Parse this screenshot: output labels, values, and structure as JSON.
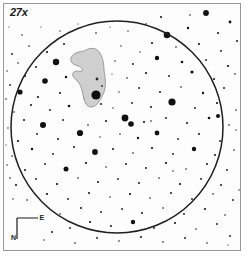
{
  "chart_data": {
    "type": "scatter",
    "magnification_label": "27x",
    "xlabel": "",
    "ylabel": "",
    "xlim": [
      0,
      244
    ],
    "ylim": [
      0,
      258
    ],
    "grid": false,
    "legend": "none",
    "field_circle": {
      "label": "true-field-circle",
      "center_x": 117,
      "center_y": 127,
      "radius": 106,
      "stroke": "#1f1f1f",
      "stroke_width": 1.5,
      "fill": "none"
    },
    "nebula": {
      "label": "nebula-outline",
      "fill": "#cfcfcf",
      "stroke": "#8a8a8a",
      "stroke_width": 0.8,
      "path": "M 86 50 C 91 47 97 48 100 53 C 103 58 104 64 104 70 C 105 76 106 82 105 88 C 104 94 101 99 98 103 C 95 107 91 108 88 106 C 85 104 84 99 83 95 C 82 90 81 86 79 83 C 77 80 74 79 73 76 C 72 73 74 71 77 71 C 79 71 81 72 82 71 C 83 69 81 67 78 66 C 75 65 72 64 71 61 C 70 58 72 55 76 53 C 80 51 83 52 86 50 Z"
    },
    "nebula_core_star": {
      "label": "nebula-core-star",
      "x": 96,
      "y": 95,
      "r": 4.6
    },
    "nebula_inner_stars": [
      {
        "x": 97,
        "y": 79,
        "r": 1.4
      },
      {
        "x": 102,
        "y": 86,
        "r": 0.9
      },
      {
        "x": 101,
        "y": 104,
        "r": 1.1
      }
    ],
    "compass": {
      "label": "compass-rose",
      "north_label": "N",
      "east_label": "E",
      "corner_x": 17,
      "corner_y": 239,
      "arm_up_y": 218,
      "arm_right_x": 38,
      "stroke": "#1a1a1a",
      "stroke_width": 1.2
    },
    "star_scale_note": "radius in px encodes magnitude; larger = brighter",
    "stars": [
      {
        "x": 161,
        "y": 17,
        "r": 1.0
      },
      {
        "x": 206,
        "y": 13,
        "r": 2.9
      },
      {
        "x": 230,
        "y": 22,
        "r": 1.4
      },
      {
        "x": 188,
        "y": 28,
        "r": 1.2
      },
      {
        "x": 218,
        "y": 33,
        "r": 1.0
      },
      {
        "x": 167,
        "y": 35,
        "r": 3.3
      },
      {
        "x": 237,
        "y": 41,
        "r": 1.0
      },
      {
        "x": 146,
        "y": 24,
        "r": 0.8
      },
      {
        "x": 128,
        "y": 31,
        "r": 0.7
      },
      {
        "x": 110,
        "y": 27,
        "r": 0.6
      },
      {
        "x": 96,
        "y": 33,
        "r": 0.8
      },
      {
        "x": 78,
        "y": 24,
        "r": 0.6
      },
      {
        "x": 60,
        "y": 31,
        "r": 0.7
      },
      {
        "x": 41,
        "y": 27,
        "r": 0.6
      },
      {
        "x": 22,
        "y": 35,
        "r": 0.8
      },
      {
        "x": 9,
        "y": 27,
        "r": 0.6
      },
      {
        "x": 152,
        "y": 43,
        "r": 1.0
      },
      {
        "x": 176,
        "y": 47,
        "r": 0.8
      },
      {
        "x": 199,
        "y": 44,
        "r": 1.1
      },
      {
        "x": 221,
        "y": 51,
        "r": 0.9
      },
      {
        "x": 140,
        "y": 52,
        "r": 0.7
      },
      {
        "x": 121,
        "y": 46,
        "r": 0.7
      },
      {
        "x": 64,
        "y": 44,
        "r": 1.0
      },
      {
        "x": 47,
        "y": 52,
        "r": 1.1
      },
      {
        "x": 29,
        "y": 46,
        "r": 0.8
      },
      {
        "x": 12,
        "y": 54,
        "r": 0.9
      },
      {
        "x": 157,
        "y": 58,
        "r": 2.2
      },
      {
        "x": 182,
        "y": 62,
        "r": 1.3
      },
      {
        "x": 206,
        "y": 60,
        "r": 0.9
      },
      {
        "x": 228,
        "y": 66,
        "r": 1.1
      },
      {
        "x": 133,
        "y": 64,
        "r": 0.9
      },
      {
        "x": 115,
        "y": 61,
        "r": 0.7
      },
      {
        "x": 56,
        "y": 62,
        "r": 3.2
      },
      {
        "x": 36,
        "y": 67,
        "r": 1.0
      },
      {
        "x": 18,
        "y": 63,
        "r": 0.8
      },
      {
        "x": 7,
        "y": 71,
        "r": 0.7
      },
      {
        "x": 146,
        "y": 73,
        "r": 1.1
      },
      {
        "x": 169,
        "y": 76,
        "r": 0.9
      },
      {
        "x": 192,
        "y": 72,
        "r": 1.6
      },
      {
        "x": 214,
        "y": 79,
        "r": 1.0
      },
      {
        "x": 235,
        "y": 74,
        "r": 0.8
      },
      {
        "x": 127,
        "y": 78,
        "r": 0.8
      },
      {
        "x": 112,
        "y": 74,
        "r": 0.6
      },
      {
        "x": 66,
        "y": 77,
        "r": 1.2
      },
      {
        "x": 45,
        "y": 81,
        "r": 2.8
      },
      {
        "x": 25,
        "y": 76,
        "r": 1.0
      },
      {
        "x": 10,
        "y": 85,
        "r": 0.9
      },
      {
        "x": 139,
        "y": 88,
        "r": 0.9
      },
      {
        "x": 160,
        "y": 92,
        "r": 1.0
      },
      {
        "x": 181,
        "y": 87,
        "r": 0.8
      },
      {
        "x": 203,
        "y": 93,
        "r": 1.2
      },
      {
        "x": 224,
        "y": 88,
        "r": 0.9
      },
      {
        "x": 119,
        "y": 92,
        "r": 0.7
      },
      {
        "x": 60,
        "y": 93,
        "r": 1.0
      },
      {
        "x": 38,
        "y": 97,
        "r": 1.1
      },
      {
        "x": 20,
        "y": 92,
        "r": 2.6
      },
      {
        "x": 6,
        "y": 99,
        "r": 0.8
      },
      {
        "x": 132,
        "y": 103,
        "r": 0.9
      },
      {
        "x": 151,
        "y": 107,
        "r": 1.0
      },
      {
        "x": 172,
        "y": 102,
        "r": 3.6
      },
      {
        "x": 195,
        "y": 108,
        "r": 0.9
      },
      {
        "x": 217,
        "y": 103,
        "r": 1.1
      },
      {
        "x": 236,
        "y": 110,
        "r": 0.8
      },
      {
        "x": 113,
        "y": 108,
        "r": 0.7
      },
      {
        "x": 69,
        "y": 106,
        "r": 1.3
      },
      {
        "x": 50,
        "y": 110,
        "r": 0.9
      },
      {
        "x": 31,
        "y": 105,
        "r": 1.0
      },
      {
        "x": 14,
        "y": 112,
        "r": 0.8
      },
      {
        "x": 125,
        "y": 118,
        "r": 3.4
      },
      {
        "x": 144,
        "y": 122,
        "r": 1.1
      },
      {
        "x": 131,
        "y": 124,
        "r": 2.8
      },
      {
        "x": 166,
        "y": 118,
        "r": 0.9
      },
      {
        "x": 187,
        "y": 123,
        "r": 1.0
      },
      {
        "x": 209,
        "y": 118,
        "r": 1.3
      },
      {
        "x": 229,
        "y": 125,
        "r": 0.8
      },
      {
        "x": 106,
        "y": 121,
        "r": 1.0
      },
      {
        "x": 88,
        "y": 125,
        "r": 0.8
      },
      {
        "x": 63,
        "y": 120,
        "r": 0.9
      },
      {
        "x": 43,
        "y": 125,
        "r": 3.0
      },
      {
        "x": 24,
        "y": 120,
        "r": 1.0
      },
      {
        "x": 8,
        "y": 128,
        "r": 0.7
      },
      {
        "x": 120,
        "y": 134,
        "r": 0.8
      },
      {
        "x": 138,
        "y": 138,
        "r": 1.2
      },
      {
        "x": 157,
        "y": 133,
        "r": 2.4
      },
      {
        "x": 178,
        "y": 139,
        "r": 0.9
      },
      {
        "x": 199,
        "y": 134,
        "r": 1.0
      },
      {
        "x": 220,
        "y": 141,
        "r": 0.9
      },
      {
        "x": 100,
        "y": 137,
        "r": 0.7
      },
      {
        "x": 80,
        "y": 133,
        "r": 3.1
      },
      {
        "x": 58,
        "y": 139,
        "r": 1.0
      },
      {
        "x": 37,
        "y": 134,
        "r": 0.9
      },
      {
        "x": 18,
        "y": 141,
        "r": 1.1
      },
      {
        "x": 113,
        "y": 149,
        "r": 1.0
      },
      {
        "x": 133,
        "y": 153,
        "r": 0.8
      },
      {
        "x": 152,
        "y": 148,
        "r": 1.1
      },
      {
        "x": 173,
        "y": 154,
        "r": 0.9
      },
      {
        "x": 194,
        "y": 149,
        "r": 2.2
      },
      {
        "x": 215,
        "y": 155,
        "r": 1.0
      },
      {
        "x": 234,
        "y": 150,
        "r": 0.8
      },
      {
        "x": 95,
        "y": 152,
        "r": 2.9
      },
      {
        "x": 74,
        "y": 147,
        "r": 1.0
      },
      {
        "x": 53,
        "y": 154,
        "r": 0.9
      },
      {
        "x": 32,
        "y": 149,
        "r": 1.2
      },
      {
        "x": 12,
        "y": 156,
        "r": 0.8
      },
      {
        "x": 126,
        "y": 164,
        "r": 1.0
      },
      {
        "x": 146,
        "y": 168,
        "r": 0.9
      },
      {
        "x": 166,
        "y": 163,
        "r": 1.1
      },
      {
        "x": 186,
        "y": 169,
        "r": 0.8
      },
      {
        "x": 207,
        "y": 164,
        "r": 1.0
      },
      {
        "x": 227,
        "y": 170,
        "r": 0.9
      },
      {
        "x": 106,
        "y": 167,
        "r": 0.8
      },
      {
        "x": 86,
        "y": 163,
        "r": 1.1
      },
      {
        "x": 66,
        "y": 169,
        "r": 2.5
      },
      {
        "x": 45,
        "y": 164,
        "r": 0.9
      },
      {
        "x": 25,
        "y": 170,
        "r": 1.0
      },
      {
        "x": 7,
        "y": 165,
        "r": 0.7
      },
      {
        "x": 118,
        "y": 179,
        "r": 0.9
      },
      {
        "x": 139,
        "y": 183,
        "r": 1.0
      },
      {
        "x": 159,
        "y": 178,
        "r": 0.8
      },
      {
        "x": 180,
        "y": 184,
        "r": 1.1
      },
      {
        "x": 201,
        "y": 179,
        "r": 0.9
      },
      {
        "x": 221,
        "y": 185,
        "r": 1.0
      },
      {
        "x": 98,
        "y": 182,
        "r": 1.0
      },
      {
        "x": 78,
        "y": 178,
        "r": 0.8
      },
      {
        "x": 57,
        "y": 184,
        "r": 1.1
      },
      {
        "x": 36,
        "y": 179,
        "r": 0.9
      },
      {
        "x": 16,
        "y": 185,
        "r": 1.0
      },
      {
        "x": 130,
        "y": 194,
        "r": 1.1
      },
      {
        "x": 150,
        "y": 198,
        "r": 0.8
      },
      {
        "x": 171,
        "y": 193,
        "r": 1.0
      },
      {
        "x": 192,
        "y": 199,
        "r": 0.9
      },
      {
        "x": 213,
        "y": 194,
        "r": 0.8
      },
      {
        "x": 233,
        "y": 200,
        "r": 0.9
      },
      {
        "x": 110,
        "y": 197,
        "r": 0.8
      },
      {
        "x": 89,
        "y": 193,
        "r": 1.0
      },
      {
        "x": 68,
        "y": 199,
        "r": 0.9
      },
      {
        "x": 47,
        "y": 194,
        "r": 1.1
      },
      {
        "x": 27,
        "y": 200,
        "r": 0.8
      },
      {
        "x": 122,
        "y": 209,
        "r": 0.9
      },
      {
        "x": 142,
        "y": 213,
        "r": 1.0
      },
      {
        "x": 163,
        "y": 208,
        "r": 0.8
      },
      {
        "x": 184,
        "y": 214,
        "r": 0.9
      },
      {
        "x": 205,
        "y": 209,
        "r": 1.1
      },
      {
        "x": 225,
        "y": 215,
        "r": 0.8
      },
      {
        "x": 101,
        "y": 212,
        "r": 0.9
      },
      {
        "x": 81,
        "y": 208,
        "r": 1.0
      },
      {
        "x": 60,
        "y": 214,
        "r": 0.8
      },
      {
        "x": 90,
        "y": 222,
        "r": 1.1
      },
      {
        "x": 111,
        "y": 226,
        "r": 1.0
      },
      {
        "x": 133,
        "y": 222,
        "r": 2.2
      },
      {
        "x": 154,
        "y": 228,
        "r": 0.9
      },
      {
        "x": 175,
        "y": 223,
        "r": 1.0
      },
      {
        "x": 196,
        "y": 229,
        "r": 0.8
      },
      {
        "x": 217,
        "y": 224,
        "r": 0.9
      },
      {
        "x": 70,
        "y": 228,
        "r": 0.9
      },
      {
        "x": 52,
        "y": 232,
        "r": 1.0
      },
      {
        "x": 97,
        "y": 238,
        "r": 0.9
      },
      {
        "x": 119,
        "y": 241,
        "r": 0.8
      },
      {
        "x": 141,
        "y": 237,
        "r": 1.0
      },
      {
        "x": 163,
        "y": 242,
        "r": 0.8
      },
      {
        "x": 185,
        "y": 238,
        "r": 0.9
      },
      {
        "x": 207,
        "y": 243,
        "r": 0.8
      },
      {
        "x": 75,
        "y": 243,
        "r": 0.8
      },
      {
        "x": 230,
        "y": 236,
        "r": 0.9
      },
      {
        "x": 44,
        "y": 240,
        "r": 0.7
      },
      {
        "x": 228,
        "y": 245,
        "r": 0.6
      },
      {
        "x": 13,
        "y": 199,
        "r": 0.7
      },
      {
        "x": 10,
        "y": 178,
        "r": 0.8
      },
      {
        "x": 190,
        "y": 15,
        "r": 0.8
      },
      {
        "x": 236,
        "y": 130,
        "r": 0.7
      },
      {
        "x": 239,
        "y": 190,
        "r": 0.7
      },
      {
        "x": 6,
        "y": 145,
        "r": 0.6
      },
      {
        "x": 218,
        "y": 116,
        "r": 2.0
      },
      {
        "x": 151,
        "y": 121,
        "r": 0.8
      },
      {
        "x": 173,
        "y": 171,
        "r": 0.7
      },
      {
        "x": 84,
        "y": 98,
        "r": 0.7
      }
    ]
  }
}
